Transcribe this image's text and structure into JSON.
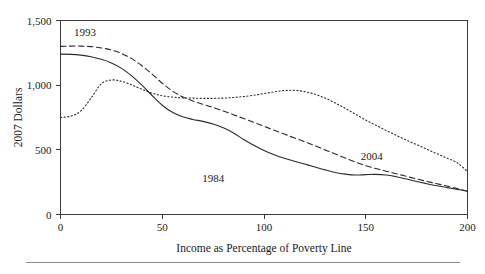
{
  "figure": {
    "footer_rule": "horizontal-rule"
  },
  "chart_data": {
    "type": "line",
    "title": "",
    "xlabel": "Income as Percentage of Poverty Line",
    "ylabel": "2007 Dollars",
    "xlim": [
      0,
      200
    ],
    "ylim": [
      0,
      1500
    ],
    "xticks": [
      0,
      50,
      100,
      150,
      200
    ],
    "xticklabels": [
      "0",
      "50",
      "100",
      "150",
      "200"
    ],
    "yticks": [
      0,
      500,
      1000,
      1500
    ],
    "yticklabels": [
      "0",
      "500",
      "1,000",
      "1,500"
    ],
    "grid": false,
    "legend": "inline-annotations",
    "x": [
      0,
      5,
      10,
      15,
      20,
      25,
      30,
      35,
      40,
      45,
      50,
      55,
      60,
      65,
      70,
      75,
      80,
      85,
      90,
      95,
      100,
      105,
      110,
      115,
      120,
      125,
      130,
      135,
      140,
      145,
      150,
      155,
      160,
      165,
      170,
      175,
      180,
      185,
      190,
      195,
      200
    ],
    "series": [
      {
        "name": "1984",
        "style": "solid",
        "values": [
          1240,
          1238,
          1232,
          1220,
          1200,
          1172,
          1130,
          1072,
          1000,
          920,
          845,
          790,
          755,
          735,
          720,
          700,
          670,
          630,
          580,
          535,
          495,
          462,
          435,
          412,
          390,
          368,
          345,
          325,
          312,
          305,
          308,
          310,
          305,
          292,
          275,
          255,
          238,
          222,
          208,
          194,
          180
        ]
      },
      {
        "name": "1993",
        "style": "dashed",
        "values": [
          1300,
          1302,
          1302,
          1298,
          1288,
          1272,
          1245,
          1205,
          1150,
          1085,
          1015,
          955,
          910,
          878,
          852,
          828,
          800,
          772,
          742,
          712,
          682,
          652,
          622,
          592,
          562,
          532,
          500,
          468,
          436,
          405,
          378,
          355,
          335,
          315,
          295,
          275,
          256,
          238,
          220,
          200,
          180
        ]
      },
      {
        "name": "2004",
        "style": "dotted",
        "values": [
          750,
          760,
          800,
          900,
          1010,
          1040,
          1030,
          1002,
          968,
          938,
          918,
          908,
          902,
          900,
          898,
          898,
          900,
          905,
          912,
          922,
          935,
          948,
          958,
          960,
          950,
          930,
          900,
          862,
          820,
          775,
          730,
          690,
          650,
          612,
          575,
          540,
          505,
          470,
          435,
          400,
          332
        ]
      }
    ],
    "annotations": [
      {
        "text": "1993",
        "x": 12,
        "y": 1380,
        "name": "series-label-1993"
      },
      {
        "text": "1984",
        "x": 75,
        "y": 250,
        "name": "series-label-1984"
      },
      {
        "text": "2004",
        "x": 153,
        "y": 420,
        "name": "series-label-2004"
      }
    ]
  }
}
